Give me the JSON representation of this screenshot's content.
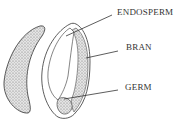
{
  "diagram": {
    "labels": [
      {
        "id": "endosperm",
        "text": "ENDOSPERM"
      },
      {
        "id": "bran",
        "text": "BRAN"
      },
      {
        "id": "germ",
        "text": "GERM"
      }
    ],
    "colors": {
      "stipple": "#9a9a9a",
      "outline": "#333333"
    }
  }
}
